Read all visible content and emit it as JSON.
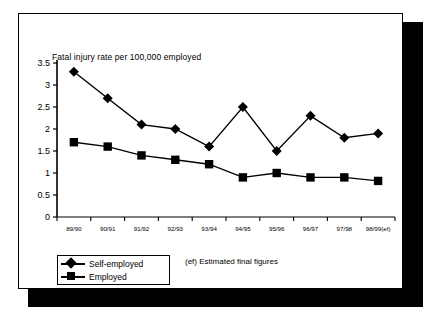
{
  "chart_data": {
    "type": "line",
    "title": "Fatal injury rate per 100,000 employed",
    "xlabel": "",
    "ylabel": "",
    "ylim": [
      0,
      3.5
    ],
    "ytick_labels": [
      "0",
      "0.5",
      "1",
      "1.5",
      "2",
      "2.5",
      "3",
      "3.5"
    ],
    "ytick_values": [
      0,
      0.5,
      1,
      1.5,
      2,
      2.5,
      3,
      3.5
    ],
    "grid": false,
    "legend_position": "bottom-left",
    "categories": [
      "89/90",
      "90/91",
      "91/92",
      "92/93",
      "93/94",
      "94/95",
      "95/96",
      "96/97",
      "97/98",
      "98/99(ef)"
    ],
    "series": [
      {
        "name": "Self-employed",
        "marker": "diamond",
        "values": [
          3.3,
          2.7,
          2.1,
          2.0,
          1.6,
          2.5,
          1.5,
          2.3,
          1.8,
          1.9
        ]
      },
      {
        "name": "Employed",
        "marker": "square",
        "values": [
          1.7,
          1.6,
          1.4,
          1.3,
          1.2,
          0.9,
          1.0,
          0.9,
          0.9,
          0.82
        ]
      }
    ],
    "annotations": [
      "(ef) Estimated final figures"
    ]
  },
  "legend": {
    "items": [
      {
        "label": "Self-employed",
        "marker": "diamond"
      },
      {
        "label": "Employed",
        "marker": "square"
      }
    ]
  },
  "footnote": {
    "text": "(ef) Estimated final figures"
  },
  "colors": {
    "series": "#000000",
    "axis": "#000000",
    "background": "#ffffff",
    "frame": "#000000",
    "shadow": "#000000"
  }
}
